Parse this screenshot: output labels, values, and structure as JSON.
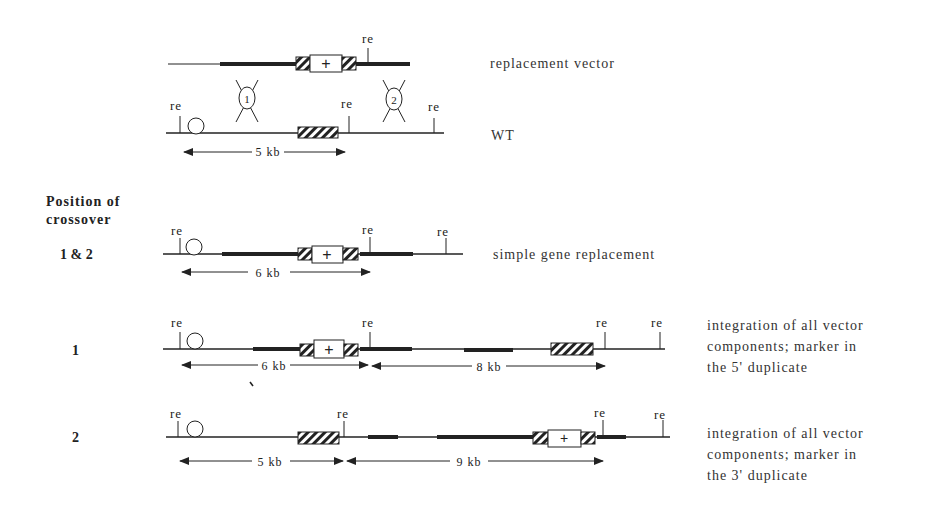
{
  "figure": {
    "section_heading_line1": "Position of",
    "section_heading_line2": "crossover",
    "restriction_site_label": "re",
    "marker_symbol": "+",
    "crossover_labels": [
      "1",
      "2"
    ]
  },
  "rows": [
    {
      "id": "vector",
      "label": "replacement vector"
    },
    {
      "id": "wt",
      "label": "WT",
      "distance_label": "5 kb"
    },
    {
      "id": "simple",
      "position": "1 & 2",
      "label": "simple gene replacement",
      "distance_label": "6 kb"
    },
    {
      "id": "pos1",
      "position": "1",
      "label_lines": [
        "integration of all vector",
        "components; marker in",
        "the 5' duplicate"
      ],
      "distance_labels": [
        "6 kb",
        "8 kb"
      ]
    },
    {
      "id": "pos2",
      "position": "2",
      "label_lines": [
        "integration of all vector",
        "components; marker in",
        "the 3' duplicate"
      ],
      "distance_labels": [
        "5 kb",
        "9 kb"
      ]
    }
  ]
}
